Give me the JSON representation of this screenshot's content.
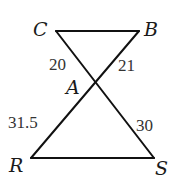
{
  "diagram": {
    "type": "geometry",
    "points": {
      "C": {
        "label": "C",
        "x": 56,
        "y": 31
      },
      "B": {
        "label": "B",
        "x": 139,
        "y": 31
      },
      "A": {
        "label": "A",
        "x": 95,
        "y": 82
      },
      "R": {
        "label": "R",
        "x": 31,
        "y": 158
      },
      "S": {
        "label": "S",
        "x": 154,
        "y": 158
      }
    },
    "segments": [
      {
        "from": "C",
        "to": "B"
      },
      {
        "from": "C",
        "to": "S"
      },
      {
        "from": "B",
        "to": "R"
      },
      {
        "from": "R",
        "to": "S"
      }
    ],
    "lengths": {
      "CA": "20",
      "BA": "21",
      "RA": "31.5",
      "SA": "30"
    },
    "colors": {
      "line": "#111111",
      "vertex_label": "#1a1a1a",
      "length_label": "#333333"
    }
  }
}
